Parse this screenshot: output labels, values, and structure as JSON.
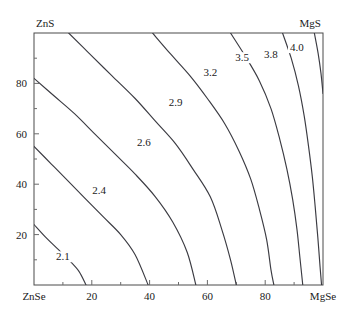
{
  "chart_data": {
    "type": "contour",
    "title": "",
    "xlabel": "",
    "ylabel": "",
    "xlim": [
      0,
      100
    ],
    "ylim": [
      0,
      100
    ],
    "grid": false,
    "legend": "none",
    "corners": {
      "top_left": "ZnS",
      "top_right": "MgS",
      "bottom_left": "ZnSe",
      "bottom_right": "MgSe"
    },
    "x_ticks": [
      {
        "value": 0,
        "label": "ZnSe"
      },
      {
        "value": 20,
        "label": "20"
      },
      {
        "value": 40,
        "label": "40"
      },
      {
        "value": 60,
        "label": "60"
      },
      {
        "value": 80,
        "label": "80"
      },
      {
        "value": 100,
        "label": "MgSe"
      }
    ],
    "x_minor_ticks": [
      10,
      30,
      50,
      70,
      90
    ],
    "y_ticks": [
      {
        "value": 20,
        "label": "20"
      },
      {
        "value": 40,
        "label": "40"
      },
      {
        "value": 60,
        "label": "60"
      },
      {
        "value": 80,
        "label": "80"
      }
    ],
    "y_minor_ticks": [
      10,
      30,
      50,
      70,
      90
    ],
    "levels": [
      2.1,
      2.4,
      2.6,
      2.9,
      3.2,
      3.5,
      3.8,
      4.0
    ],
    "contour_label_text": {
      "l21": "2.1",
      "l24": "2.4",
      "l26": "2.6",
      "l29": "2.9",
      "l32": "3.2",
      "l35": "3.5",
      "l38": "3.8",
      "l40": "4.0"
    },
    "contours": [
      {
        "level": 2.1,
        "label": "2.1",
        "label_xy": [
          10,
          10
        ],
        "points": [
          [
            0,
            24
          ],
          [
            4,
            19
          ],
          [
            8,
            14.5
          ],
          [
            12,
            10
          ],
          [
            15.5,
            5.5
          ],
          [
            18,
            0
          ]
        ]
      },
      {
        "level": 2.4,
        "label": "2.4",
        "label_xy": [
          22.5,
          36
        ],
        "points": [
          [
            0,
            55
          ],
          [
            6,
            48
          ],
          [
            12,
            41
          ],
          [
            18,
            34
          ],
          [
            24,
            27
          ],
          [
            30,
            20
          ],
          [
            35,
            12
          ],
          [
            39.5,
            0
          ]
        ]
      },
      {
        "level": 2.6,
        "label": "2.6",
        "label_xy": [
          38,
          55
        ],
        "points": [
          [
            0,
            82
          ],
          [
            7,
            75
          ],
          [
            14,
            68
          ],
          [
            21,
            60
          ],
          [
            28,
            52
          ],
          [
            35,
            44
          ],
          [
            42,
            35
          ],
          [
            48,
            25
          ],
          [
            53,
            13
          ],
          [
            56,
            0
          ]
        ]
      },
      {
        "level": 2.9,
        "label": "2.9",
        "label_xy": [
          49,
          71
        ],
        "points": [
          [
            12,
            100
          ],
          [
            19,
            92
          ],
          [
            27,
            83
          ],
          [
            35,
            74
          ],
          [
            42,
            65
          ],
          [
            49,
            56
          ],
          [
            55,
            46
          ],
          [
            61,
            35
          ],
          [
            65,
            22
          ],
          [
            68,
            10
          ],
          [
            70,
            0
          ]
        ]
      },
      {
        "level": 3.2,
        "label": "3.2",
        "label_xy": [
          61,
          83
        ],
        "points": [
          [
            41,
            100
          ],
          [
            47,
            92
          ],
          [
            54,
            83
          ],
          [
            60,
            74
          ],
          [
            66,
            64
          ],
          [
            71,
            53
          ],
          [
            75,
            42
          ],
          [
            78,
            30
          ],
          [
            80.5,
            18
          ],
          [
            82,
            6
          ],
          [
            83,
            0
          ]
        ]
      },
      {
        "level": 3.5,
        "label": "3.5",
        "label_xy": [
          72,
          89
        ],
        "points": [
          [
            68,
            100
          ],
          [
            73,
            91
          ],
          [
            78,
            81
          ],
          [
            82,
            70
          ],
          [
            85,
            58
          ],
          [
            87.5,
            46
          ],
          [
            89.5,
            34
          ],
          [
            91,
            22
          ],
          [
            92,
            11
          ],
          [
            93,
            0
          ]
        ]
      },
      {
        "level": 3.8,
        "label": "3.8",
        "label_xy": [
          82,
          90
        ],
        "points": [
          [
            86,
            100
          ],
          [
            89,
            90
          ],
          [
            91.5,
            79
          ],
          [
            93.5,
            67
          ],
          [
            95,
            55
          ],
          [
            96.3,
            43
          ],
          [
            97.3,
            31
          ],
          [
            98.2,
            19
          ],
          [
            99,
            7
          ],
          [
            99.5,
            0
          ]
        ]
      },
      {
        "level": 4.0,
        "label": "4.0",
        "label_xy": [
          91,
          93
        ],
        "points": [
          [
            97,
            100
          ],
          [
            98.3,
            92
          ],
          [
            99.3,
            84
          ],
          [
            100,
            76
          ]
        ]
      }
    ]
  }
}
